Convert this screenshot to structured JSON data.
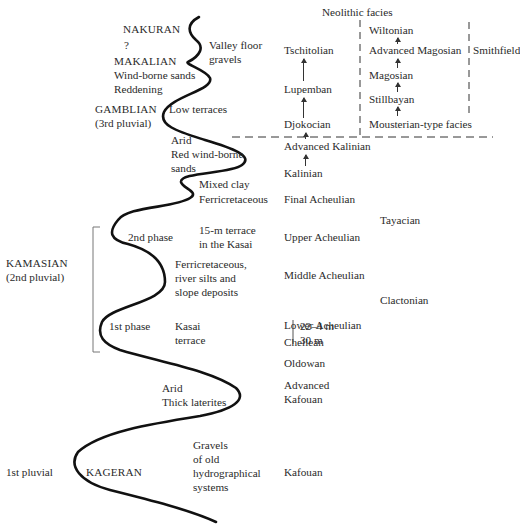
{
  "climate_periods": {
    "nakuran": "NAKURAN",
    "nakuran_question": "?",
    "makalian": "MAKALIAN",
    "makalian_notes": [
      "Wind-borne sands",
      "Reddening"
    ],
    "gamblian": "GAMBLIAN",
    "gamblian_sub": "(3rd pluvial)",
    "kamasian": "KAMASIAN",
    "kamasian_sub": "(2nd pluvial)",
    "first_pluvial": "1st pluvial",
    "kageran": "KAGERAN"
  },
  "deposits": {
    "valley_floor": [
      "Valley floor",
      "gravels"
    ],
    "low_terraces": "Low terraces",
    "arid_red": [
      "Arid",
      "Red wind-borne",
      "sands"
    ],
    "mixed_clay": "Mixed clay",
    "ferricretaceous": "Ferricretaceous",
    "phase2": "2nd phase",
    "terrace_15m": [
      "15-m terrace",
      "in the Kasai"
    ],
    "ferric_silts": [
      "Ferricretaceous,",
      "river silts and",
      "slope deposits"
    ],
    "phase1": "1st phase",
    "kasai_terrace": [
      "Kasai",
      "terrace"
    ],
    "terrace_heights": [
      "22–4 m",
      "30 m"
    ],
    "arid_laterites": [
      "Arid",
      "Thick laterites"
    ],
    "gravels_old": [
      "Gravels",
      "of old",
      "hydrographical",
      "systems"
    ]
  },
  "industries": {
    "neolithic": "Neolithic facies",
    "tschitolian": "Tschitolian",
    "lupemban": "Lupemban",
    "djokocian": "Djokocian",
    "advanced_kalinian": "Advanced Kalinian",
    "kalinian": "Kalinian",
    "final_acheulian": "Final Acheulian",
    "upper_acheulian": "Upper Acheulian",
    "middle_acheulian": "Middle Acheulian",
    "lower_acheulian": "Lower Acheulian",
    "chellean": "Chellean",
    "oldowan": "Oldowan",
    "advanced_kafouan": [
      "Advanced",
      "Kafouan"
    ],
    "kafouan": "Kafouan",
    "tayacian": "Tayacian",
    "clactonian": "Clactonian",
    "wiltonian": "Wiltonian",
    "advanced_magosian": "Advanced Magosian",
    "magosian": "Magosian",
    "stillbayan": "Stillbayan",
    "mousterian": "Mousterian-type facies",
    "smithfield": "Smithfield"
  }
}
